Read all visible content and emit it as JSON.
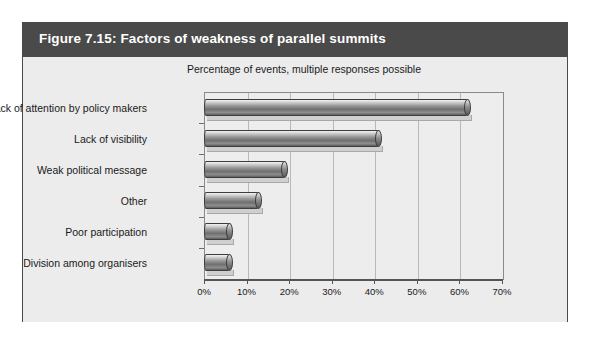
{
  "figure": {
    "title": "Figure 7.15: Factors of weakness of parallel summits",
    "subtitle": "Percentage of events, multiple responses possible"
  },
  "colors": {
    "title_band": "#4a4a4a",
    "canvas": "#ececec",
    "plot_background": "#ededed",
    "bar_dark": "#6f6f6f",
    "bar_light": "#f2f2f2",
    "gridline": "#b9b9b9",
    "axis": "#555555"
  },
  "chart_data": {
    "type": "bar",
    "orientation": "horizontal",
    "title": "Figure 7.15: Factors of weakness of parallel summits",
    "subtitle": "Percentage of events, multiple responses possible",
    "xlabel": "",
    "ylabel": "",
    "categories": [
      "Lack of attention by policy makers",
      "Lack of visibility",
      "Weak political message",
      "Other",
      "Poor participation",
      "Division among organisers"
    ],
    "values": [
      62,
      41,
      19,
      13,
      6,
      6
    ],
    "xlim": [
      0,
      70
    ],
    "xticks": [
      0,
      10,
      20,
      30,
      40,
      50,
      60,
      70
    ],
    "xtick_labels": [
      "0%",
      "10%",
      "20%",
      "30%",
      "40%",
      "50%",
      "60%",
      "70%"
    ],
    "grid": true,
    "grid_axis": "x",
    "legend": false
  }
}
